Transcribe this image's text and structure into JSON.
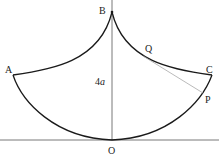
{
  "diagram": {
    "colors": {
      "curve": "#1a1a1a",
      "axis": "#555555",
      "tangent": "#a8a8a8",
      "text": "#222222",
      "background": "#ffffff"
    },
    "labels": {
      "A": "A",
      "B": "B",
      "C": "C",
      "O": "O",
      "P": "P",
      "Q": "Q",
      "height": "4",
      "height_var": "a"
    },
    "points": {
      "A": [
        13,
        75
      ],
      "B": [
        112,
        12
      ],
      "C": [
        212,
        75
      ],
      "O": [
        112,
        140
      ],
      "P": [
        203,
        93
      ],
      "Q": [
        145,
        57
      ]
    }
  }
}
